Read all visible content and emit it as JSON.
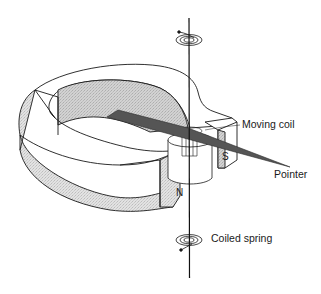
{
  "diagram": {
    "labels": {
      "moving_coil": "Moving coil",
      "pointer": "Pointer",
      "coiled_spring": "Coiled spring"
    },
    "poles": {
      "north": "N",
      "south": "S"
    },
    "colors": {
      "magnet_face": "#dcdcdc",
      "magnet_inner": "#cfcfcf",
      "pointer": "#555555",
      "line": "#1a1a1a",
      "background": "#ffffff"
    }
  }
}
